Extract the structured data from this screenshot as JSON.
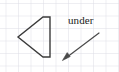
{
  "figure": {
    "canvas": {
      "width": 119,
      "height": 72,
      "background": "#ffffff"
    },
    "grid": {
      "name": "graph-paper-grid",
      "cell_size": 12.5,
      "origin_x": 5.5,
      "origin_y": 3.0,
      "color": "#d9d9e2",
      "line_width": 0.9,
      "visible": true
    },
    "shape": {
      "name": "pentagon-shape",
      "label": "",
      "type": "polygon",
      "stroke": "#3b3b3b",
      "stroke_width": 1.4,
      "fill": "none",
      "points": "43,17 50,17 50,57 43,57 18,37"
    },
    "annotation": {
      "name": "under-annotation",
      "text": "under",
      "text_x": 68,
      "text_y": 15,
      "font_size": 11,
      "color": "#1c1c1c"
    },
    "arrow": {
      "name": "annotation-arrow",
      "from_x": 99,
      "from_y": 33,
      "to_x": 63,
      "to_y": 60,
      "stroke": "#4a4a4a",
      "stroke_width": 1.2,
      "head_length": 7,
      "head_width": 4.5
    }
  }
}
